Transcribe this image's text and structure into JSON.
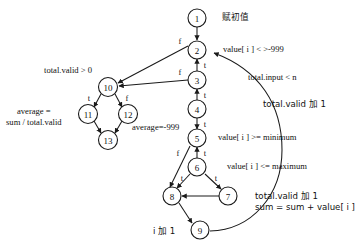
{
  "figure": {
    "type": "flowchart",
    "nodes": [
      {
        "id": "1",
        "label": "1",
        "cx": 197,
        "cy": 18
      },
      {
        "id": "2",
        "label": "2",
        "cx": 197,
        "cy": 50
      },
      {
        "id": "3",
        "label": "3",
        "cx": 197,
        "cy": 80
      },
      {
        "id": "4",
        "label": "4",
        "cx": 197,
        "cy": 109
      },
      {
        "id": "5",
        "label": "5",
        "cx": 197,
        "cy": 138
      },
      {
        "id": "6",
        "label": "6",
        "cx": 197,
        "cy": 167
      },
      {
        "id": "7",
        "label": "7",
        "cx": 228,
        "cy": 196
      },
      {
        "id": "8",
        "label": "8",
        "cx": 172,
        "cy": 196
      },
      {
        "id": "9",
        "label": "9",
        "cx": 200,
        "cy": 230
      },
      {
        "id": "10",
        "label": "10",
        "cx": 108,
        "cy": 87
      },
      {
        "id": "11",
        "label": "11",
        "cx": 88,
        "cy": 114
      },
      {
        "id": "12",
        "label": "12",
        "cx": 128,
        "cy": 114
      },
      {
        "id": "13",
        "label": "13",
        "cx": 108,
        "cy": 140
      }
    ],
    "branch_labels": [
      {
        "text": "f",
        "x": 180,
        "y": 41
      },
      {
        "text": "t",
        "x": 205,
        "y": 65
      },
      {
        "text": "f",
        "x": 180,
        "y": 72
      },
      {
        "text": "t",
        "x": 205,
        "y": 95
      },
      {
        "text": "t",
        "x": 205,
        "y": 124
      },
      {
        "text": "f",
        "x": 178,
        "y": 153
      },
      {
        "text": "t",
        "x": 205,
        "y": 153
      },
      {
        "text": "t",
        "x": 182,
        "y": 178
      },
      {
        "text": "t",
        "x": 216,
        "y": 178
      },
      {
        "text": "t",
        "x": 89,
        "y": 98
      },
      {
        "text": "f",
        "x": 127,
        "y": 98
      }
    ],
    "annotations": [
      {
        "name": "node1-note",
        "text": "赋初值",
        "x": 222,
        "y": 12,
        "cjk": true
      },
      {
        "name": "node2-condition",
        "text": "value[ i ] < >-999",
        "x": 223,
        "y": 44,
        "cjk": false
      },
      {
        "name": "node10-condition",
        "text": "total.valid > 0",
        "x": 44,
        "y": 65,
        "cjk": false
      },
      {
        "name": "input-condition",
        "text": "total.input < n",
        "x": 248,
        "y": 72,
        "cjk": false
      },
      {
        "name": "valid-increment-1",
        "text": "total.valid 加 1",
        "x": 263,
        "y": 99,
        "cjk": true
      },
      {
        "name": "average-formula",
        "text": "average =\nsum / total.valid",
        "x": 6,
        "y": 106,
        "cjk": false
      },
      {
        "name": "average-neg999",
        "text": "average=-999",
        "x": 132,
        "y": 122,
        "cjk": false
      },
      {
        "name": "minimum-condition",
        "text": "value[ i ] >= minimum",
        "x": 218,
        "y": 132,
        "cjk": false
      },
      {
        "name": "maximum-condition",
        "text": "value[ i ] <= maximum",
        "x": 227,
        "y": 161,
        "cjk": false
      },
      {
        "name": "valid-increment-2",
        "text": "total.valid 加 1\nsum = sum + value[ i ]",
        "x": 255,
        "y": 191,
        "cjk": true
      },
      {
        "name": "i-increment",
        "text": "i 加 1",
        "x": 153,
        "y": 226,
        "cjk": true
      }
    ]
  }
}
